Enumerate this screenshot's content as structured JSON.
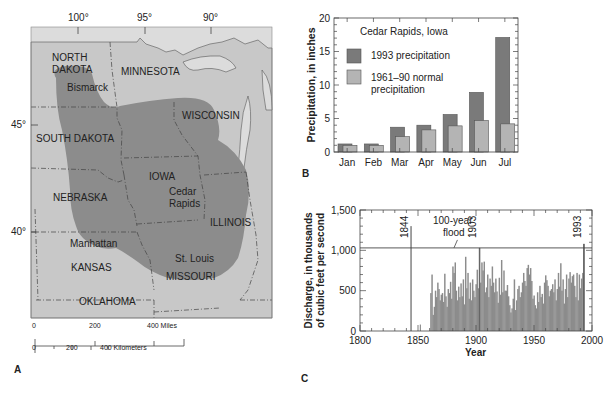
{
  "panels": {
    "a": {
      "letter": "A",
      "longitude_labels": [
        "100°",
        "95°",
        "90°"
      ],
      "latitude_labels": [
        "45°",
        "40°"
      ],
      "states": {
        "north_dakota_1": "NORTH",
        "north_dakota_2": "DAKOTA",
        "minnesota": "MINNESOTA",
        "wisconsin": "WISCONSIN",
        "south_dakota": "SOUTH DAKOTA",
        "nebraska": "NEBRASKA",
        "iowa": "IOWA",
        "illinois": "ILLINOIS",
        "kansas": "KANSAS",
        "missouri": "MISSOURI",
        "oklahoma": "OKLAHOMA"
      },
      "cities": {
        "bismarck": "Bismarck",
        "cedar_1": "Cedar",
        "cedar_2": "Rapids",
        "manhattan": "Manhattan",
        "st_louis": "St. Louis"
      },
      "scale": {
        "miles_0": "0",
        "miles_200": "200",
        "miles_400": "400 Miles",
        "km_0": "0",
        "km_200": "200",
        "km_400": "400 Kilometers"
      },
      "colors": {
        "land": "#c4c4c4",
        "flood_area": "#8a8a8a",
        "water": "#dcdcdc"
      }
    },
    "b": {
      "letter": "B"
    },
    "c": {
      "letter": "C"
    }
  },
  "chart_data": [
    {
      "id": "B",
      "type": "bar",
      "title": "Cedar Rapids, Iowa",
      "xlabel": "",
      "ylabel": "Precipitation, in inches",
      "ylim": [
        0,
        20
      ],
      "yticks": [
        "0",
        "5",
        "10",
        "15",
        "20"
      ],
      "categories": [
        "Jan",
        "Feb",
        "Mar",
        "Apr",
        "May",
        "Jun",
        "Jul"
      ],
      "series": [
        {
          "name": "1993 precipitation",
          "color": "#7a7a7a",
          "values": [
            1.2,
            1.2,
            3.7,
            4.0,
            5.6,
            8.9,
            17.1
          ]
        },
        {
          "name": "1961–90 normal precipitation",
          "color": "#b4b4b4",
          "values": [
            1.0,
            1.0,
            2.3,
            3.3,
            3.9,
            4.7,
            4.2
          ]
        }
      ],
      "legend_lines": {
        "s1": "1993 precipitation",
        "s2a": "1961–90 normal",
        "s2b": "precipitation"
      },
      "grid": false,
      "legend_position": "upper-left inside"
    },
    {
      "id": "C",
      "type": "bar",
      "title": "",
      "xlabel": "Year",
      "ylabel_line1": "Discharge, in thousands",
      "ylabel_line2": "of cubic feet per second",
      "xlim": [
        1800,
        2000
      ],
      "ylim": [
        0,
        1500
      ],
      "xticks": [
        "1800",
        "1850",
        "1900",
        "1950",
        "2000"
      ],
      "yticks": [
        "0",
        "500",
        "1,000",
        "1,500"
      ],
      "reference_line": {
        "label_1": "100-year",
        "label_2": "flood",
        "value": 1030
      },
      "annotations": [
        {
          "year": "1844",
          "value": 1300
        },
        {
          "year": "1903",
          "value": 1030
        },
        {
          "year": "1993",
          "value": 1080
        }
      ],
      "series": [
        {
          "name": "Annual peak discharge",
          "color": "#8c8c8c",
          "x": [
            1861,
            1862,
            1863,
            1864,
            1865,
            1866,
            1867,
            1868,
            1869,
            1870,
            1871,
            1872,
            1873,
            1874,
            1875,
            1876,
            1877,
            1878,
            1879,
            1880,
            1881,
            1882,
            1883,
            1884,
            1885,
            1886,
            1887,
            1888,
            1889,
            1890,
            1891,
            1892,
            1893,
            1894,
            1895,
            1896,
            1897,
            1898,
            1899,
            1900,
            1901,
            1902,
            1903,
            1904,
            1905,
            1906,
            1907,
            1908,
            1909,
            1910,
            1911,
            1912,
            1913,
            1914,
            1915,
            1916,
            1917,
            1918,
            1919,
            1920,
            1921,
            1922,
            1923,
            1924,
            1925,
            1926,
            1927,
            1928,
            1929,
            1930,
            1931,
            1932,
            1933,
            1934,
            1935,
            1936,
            1937,
            1938,
            1939,
            1940,
            1941,
            1942,
            1943,
            1944,
            1945,
            1946,
            1947,
            1948,
            1949,
            1950,
            1951,
            1952,
            1953,
            1954,
            1955,
            1956,
            1957,
            1958,
            1959,
            1960,
            1961,
            1962,
            1963,
            1964,
            1965,
            1966,
            1967,
            1968,
            1969,
            1970,
            1971,
            1972,
            1973,
            1974,
            1975,
            1976,
            1977,
            1978,
            1979,
            1980,
            1981,
            1982,
            1983,
            1984,
            1985,
            1986,
            1987,
            1988,
            1989,
            1990,
            1991,
            1992,
            1993
          ],
          "values": [
            470,
            700,
            200,
            300,
            500,
            420,
            600,
            520,
            380,
            450,
            470,
            360,
            710,
            430,
            300,
            520,
            470,
            610,
            400,
            800,
            720,
            850,
            500,
            380,
            550,
            420,
            590,
            430,
            640,
            330,
            920,
            530,
            720,
            400,
            600,
            380,
            640,
            500,
            420,
            580,
            760,
            530,
            1030,
            600,
            850,
            750,
            860,
            480,
            540,
            700,
            420,
            650,
            560,
            800,
            600,
            480,
            650,
            490,
            350,
            660,
            450,
            880,
            480,
            750,
            500,
            500,
            570,
            430,
            320,
            230,
            280,
            400,
            640,
            260,
            380,
            520,
            560,
            420,
            480,
            600,
            720,
            620,
            560,
            780,
            820,
            700,
            780,
            620,
            400,
            440,
            320,
            280,
            480,
            360,
            560,
            420,
            460,
            340,
            600,
            690,
            630,
            560,
            430,
            500,
            520,
            580,
            480,
            640,
            380,
            520,
            720,
            550,
            840,
            500,
            640,
            340,
            520,
            700,
            420,
            650,
            730,
            600,
            680,
            700,
            560,
            420,
            720,
            380,
            700,
            530,
            650,
            720,
            1080
          ]
        }
      ],
      "grid": false
    }
  ]
}
